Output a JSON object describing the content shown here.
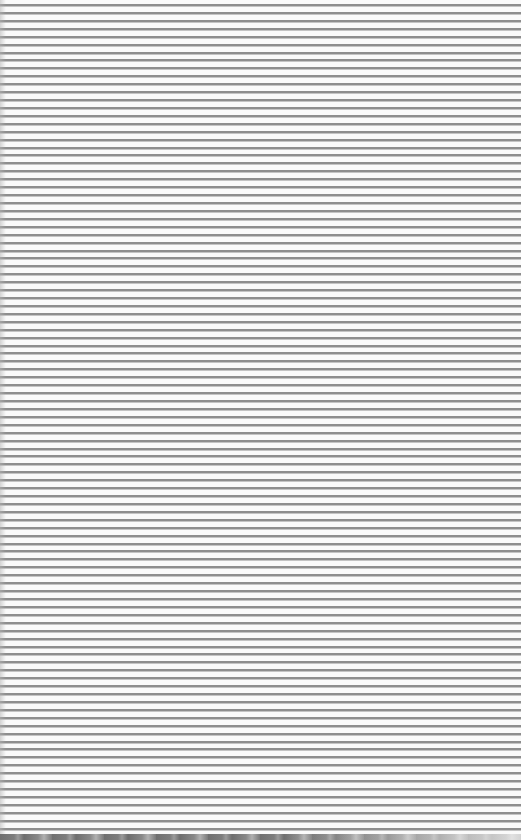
{
  "page": {
    "kind": "ruled-lines-pattern",
    "background_color": "#fafafa",
    "line_color": "#8e8e8e",
    "line_spacing_px": 7.92,
    "line_count": 106,
    "bottom_band_color": "#7a7a7a"
  }
}
